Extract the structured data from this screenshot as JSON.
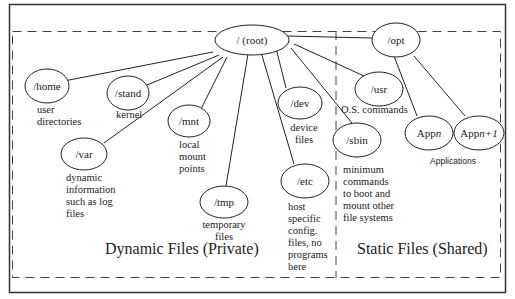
{
  "diagram": {
    "root": {
      "label": "/ (root)"
    },
    "nodes": {
      "home": {
        "label": "/home",
        "desc": [
          "user",
          "directories"
        ]
      },
      "stand": {
        "label": "/stand",
        "desc": [
          "kernel"
        ]
      },
      "mnt": {
        "label": "/mnt",
        "desc": [
          "local",
          "mount",
          "points"
        ]
      },
      "var": {
        "label": "/var",
        "desc": [
          "dynamic",
          "information",
          "such as log",
          "files"
        ]
      },
      "tmp": {
        "label": "/tmp",
        "desc": [
          "temporary",
          "files"
        ]
      },
      "dev": {
        "label": "/dev",
        "desc": [
          "device",
          "files"
        ]
      },
      "etc": {
        "label": "/etc",
        "desc": [
          "host",
          "specific",
          "config.",
          "files, no",
          "programs",
          "here"
        ]
      },
      "usr": {
        "label": "/usr",
        "desc": [
          "O.S. commands"
        ]
      },
      "sbin": {
        "label": "/sbin",
        "desc": [
          "minimum",
          "commands",
          "to boot and",
          "mount other",
          "file systems"
        ]
      },
      "opt": {
        "label": "/opt"
      },
      "appn": {
        "label_prefix": "App",
        "label_var": "n"
      },
      "appn1": {
        "label_prefix": "App",
        "label_var": "n+1"
      }
    },
    "applications_label": "Applications",
    "regions": {
      "dynamic": "Dynamic Files (Private)",
      "static": "Static Files (Shared)"
    },
    "edges": [
      [
        "root",
        "home"
      ],
      [
        "root",
        "stand"
      ],
      [
        "root",
        "mnt"
      ],
      [
        "root",
        "var"
      ],
      [
        "root",
        "tmp"
      ],
      [
        "root",
        "etc"
      ],
      [
        "root",
        "dev"
      ],
      [
        "root",
        "sbin"
      ],
      [
        "root",
        "usr"
      ],
      [
        "root",
        "opt"
      ],
      [
        "opt",
        "appn"
      ],
      [
        "opt",
        "appn1"
      ]
    ],
    "colors": {
      "stroke": "#222222",
      "background": "#ffffff"
    }
  }
}
